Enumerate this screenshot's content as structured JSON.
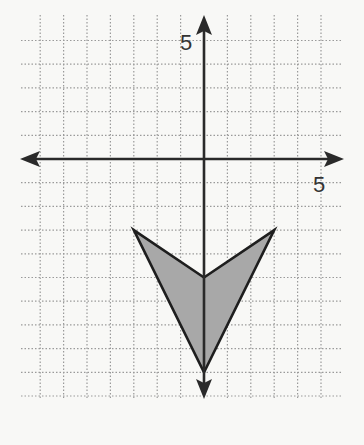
{
  "diagram": {
    "type": "coordinate-plane",
    "grid": {
      "xmin": -8,
      "xmax": 5,
      "ymin": -10,
      "ymax": 5,
      "style": "dotted"
    },
    "axes": {
      "x_label_tick": {
        "value": 5,
        "text": "5"
      },
      "y_label_tick": {
        "value": 5,
        "text": "5"
      }
    },
    "shape": {
      "name": "arrowhead-polygon",
      "vertices": [
        [
          -3,
          -3
        ],
        [
          0,
          -5
        ],
        [
          3,
          -3
        ],
        [
          0,
          -9
        ]
      ],
      "fill": "#a8a8a8",
      "stroke": "#1e1e1e"
    }
  },
  "labels": {
    "x_tick_5": "5",
    "y_tick_5": "5"
  }
}
